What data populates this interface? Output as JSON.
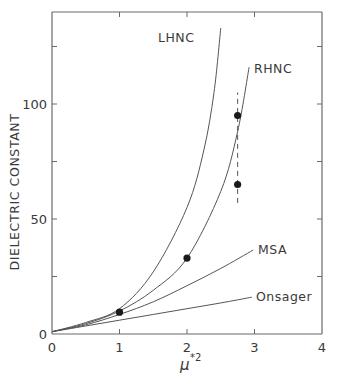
{
  "chart_data": {
    "type": "line",
    "title": "",
    "xlabel": "μ*²",
    "ylabel": "DIELECTRIC CONSTANT",
    "xlim": [
      0,
      4
    ],
    "ylim": [
      0,
      140
    ],
    "x_ticks": [
      0,
      1,
      2,
      3,
      4
    ],
    "x_tick_labels": [
      "0",
      "1",
      "2",
      "3",
      "4"
    ],
    "y_ticks": [
      0,
      25,
      50,
      75,
      100,
      125
    ],
    "y_tick_labels": [
      "0",
      "",
      "50",
      "",
      "100",
      ""
    ],
    "grid": false,
    "legend": "inline curve labels",
    "series": [
      {
        "name": "LHNC",
        "x": [
          0,
          0.5,
          1.0,
          1.5,
          2.0,
          2.25,
          2.4,
          2.5
        ],
        "y": [
          1,
          5,
          11,
          27,
          55,
          80,
          105,
          133
        ]
      },
      {
        "name": "RHNC",
        "x": [
          0,
          0.5,
          1.0,
          1.5,
          2.0,
          2.5,
          2.75,
          2.92
        ],
        "y": [
          1,
          4.5,
          10,
          19,
          33,
          62,
          88,
          116
        ]
      },
      {
        "name": "MSA",
        "x": [
          0,
          0.5,
          1.0,
          1.5,
          2.0,
          2.5,
          2.98
        ],
        "y": [
          1,
          4,
          8.5,
          14,
          21,
          28.5,
          36.5
        ]
      },
      {
        "name": "Onsager",
        "x": [
          0,
          0.5,
          1.0,
          1.5,
          2.0,
          2.5,
          2.96
        ],
        "y": [
          1,
          3.5,
          6,
          8.5,
          11,
          13.5,
          16
        ]
      }
    ],
    "points": {
      "name": "simulation data",
      "x": [
        1.0,
        2.0,
        2.75,
        2.75
      ],
      "y": [
        9.5,
        33,
        95,
        65
      ]
    },
    "error_bar": {
      "x": 2.75,
      "y_low": 57,
      "y_high": 105,
      "style": "dashed"
    }
  },
  "labels": {
    "lhnc": "LHNC",
    "rhnc": "RHNC",
    "msa": "MSA",
    "onsager": "Onsager",
    "ylabel": "DIELECTRIC CONSTANT",
    "xlabel_base": "μ",
    "xlabel_sup": "*2",
    "y0": "0",
    "y50": "50",
    "y100": "100",
    "x0": "0",
    "x1": "1",
    "x2": "2",
    "x3": "3",
    "x4": "4"
  },
  "colors": {
    "ink": "#3a3a3a",
    "background": "#ffffff"
  }
}
